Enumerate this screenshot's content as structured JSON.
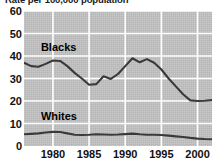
{
  "chart_data": {
    "type": "line",
    "title": "Rate per 100,000 population",
    "xlabel": "",
    "ylabel": "",
    "xlim": [
      1976,
      2002
    ],
    "ylim": [
      0,
      60
    ],
    "ytick_values": [
      0,
      10,
      20,
      30,
      40,
      50,
      60
    ],
    "ytick_labels": [
      "0",
      "10",
      "20",
      "30",
      "40",
      "50",
      "60"
    ],
    "xtick_values": [
      1980,
      1985,
      1990,
      1995,
      2000
    ],
    "xtick_labels": [
      "1980",
      "1985",
      "1990",
      "1995",
      "2000"
    ],
    "grid": true,
    "grid_color": "#ffffff",
    "plot_background": "#c2c2c2",
    "line_color": "#3a3a3a",
    "legend_position": "inline-annotation",
    "x": [
      1976,
      1977,
      1978,
      1979,
      1980,
      1981,
      1982,
      1983,
      1984,
      1985,
      1986,
      1987,
      1988,
      1989,
      1990,
      1991,
      1992,
      1993,
      1994,
      1995,
      1996,
      1997,
      1998,
      1999,
      2000,
      2001,
      2002
    ],
    "series": [
      {
        "name": "Blacks",
        "label_value": "Blacks",
        "color": "#3a3a3a",
        "values": [
          37.0,
          35.5,
          35.2,
          36.5,
          38.0,
          37.8,
          35.5,
          32.5,
          30.0,
          27.2,
          27.5,
          31.0,
          29.8,
          32.0,
          35.5,
          39.0,
          37.2,
          38.6,
          37.0,
          34.0,
          30.0,
          26.5,
          23.0,
          20.3,
          20.0,
          20.1,
          20.4
        ]
      },
      {
        "name": "Whites",
        "label_value": "Whites",
        "color": "#3a3a3a",
        "values": [
          5.2,
          5.4,
          5.6,
          6.0,
          6.3,
          6.2,
          5.6,
          5.0,
          4.9,
          5.0,
          5.2,
          5.1,
          5.0,
          5.1,
          5.3,
          5.5,
          5.2,
          5.0,
          5.0,
          4.9,
          4.6,
          4.3,
          4.0,
          3.6,
          3.3,
          3.1,
          3.0
        ]
      }
    ],
    "annotations": [
      {
        "text": "Blacks",
        "x_pct": 9,
        "y_value": 43.5
      },
      {
        "text": "Whites",
        "x_pct": 9,
        "y_value": 13.0
      }
    ]
  }
}
